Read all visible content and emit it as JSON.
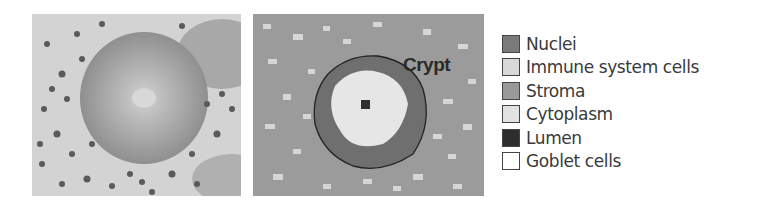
{
  "figure": {
    "left_panel": {
      "label": "histology-image"
    },
    "right_panel": {
      "label": "segmentation-map",
      "annotation": "Crypt"
    }
  },
  "legend": {
    "items": [
      {
        "label": "Nuclei",
        "color": "#7a7a7a"
      },
      {
        "label": "Immune system cells",
        "color": "#d8d8d8"
      },
      {
        "label": "Stroma",
        "color": "#999999"
      },
      {
        "label": "Cytoplasm",
        "color": "#e2e2e2"
      },
      {
        "label": "Lumen",
        "color": "#2e2e2e"
      },
      {
        "label": "Goblet cells",
        "color": "#ffffff"
      }
    ]
  }
}
